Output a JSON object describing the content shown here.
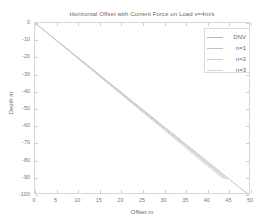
{
  "chart_data": {
    "type": "line",
    "title": "Horizontal Offset with Current Force on Load v=4m/s",
    "xlabel": "Offset m",
    "ylabel": "Depth m",
    "xlim": [
      0,
      50
    ],
    "ylim": [
      -100,
      0
    ],
    "grid": false,
    "legend_position": "upper-right",
    "xticks": [
      0,
      5,
      10,
      15,
      20,
      25,
      30,
      35,
      40,
      45,
      50
    ],
    "xtick_labels": [
      "0",
      "5",
      "10",
      "15",
      "20",
      "25",
      "30",
      "35",
      "40",
      "45",
      "50"
    ],
    "yticks": [
      0,
      -10,
      -20,
      -30,
      -40,
      -50,
      -60,
      -70,
      -80,
      -90,
      -100
    ],
    "ytick_labels": [
      "0",
      "-10",
      "-20",
      "-30",
      "-40",
      "-50",
      "-60",
      "-70",
      "-80",
      "-90",
      "-100"
    ],
    "series": [
      {
        "name": "DNV",
        "color": "#b9b9b9",
        "x": [
          0,
          5,
          10,
          15,
          20,
          25,
          30,
          35,
          40,
          45,
          49.5
        ],
        "y": [
          0,
          -10.1,
          -20.2,
          -30.3,
          -40.4,
          -50.5,
          -60.6,
          -70.7,
          -80.8,
          -90.9,
          -100
        ]
      },
      {
        "name": "n=1",
        "color": "#c4c4c4",
        "x": [
          0,
          5,
          10,
          15,
          20,
          25,
          30,
          35,
          40,
          44.5
        ],
        "y": [
          0,
          -10.2,
          -20.4,
          -30.6,
          -40.8,
          -51.0,
          -61.2,
          -71.4,
          -81.6,
          -90.8
        ]
      },
      {
        "name": "n=2",
        "color": "#cdcdcd",
        "x": [
          0,
          5,
          10,
          15,
          20,
          25,
          30,
          35,
          40,
          44.0
        ],
        "y": [
          0,
          -10.3,
          -20.6,
          -30.9,
          -41.2,
          -51.5,
          -61.8,
          -72.1,
          -82.4,
          -90.6
        ]
      },
      {
        "name": "n=3",
        "color": "#d4d4d4",
        "x": [
          0,
          5,
          10,
          15,
          20,
          25,
          30,
          35,
          40,
          43.6
        ],
        "y": [
          0,
          -10.4,
          -20.8,
          -31.2,
          -41.6,
          -52.0,
          -62.4,
          -72.8,
          -83.2,
          -90.6
        ]
      }
    ]
  },
  "legend": {
    "items": [
      {
        "label": "DNV"
      },
      {
        "label": "n=1"
      },
      {
        "label": "n=2"
      },
      {
        "label": "n=3"
      }
    ]
  }
}
